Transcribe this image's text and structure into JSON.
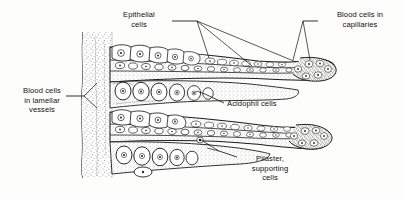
{
  "figure": {
    "background_color": "#fdfdfb",
    "ink_color": "#1a1a1a",
    "stipple_color": "#8a8a88"
  },
  "labels": {
    "epithelial": {
      "name": "Epithelial cells",
      "line1": "Epithelial",
      "line2": "cells"
    },
    "blood_capillaries": {
      "name": "Blood cells in capillaries",
      "line1": "Blood cells in",
      "line2": "capillaries"
    },
    "blood_lamellar": {
      "name": "Blood cells in lamellar vessels",
      "line1": "Blood cells",
      "line2": "in lamellar",
      "line3": "vessels"
    },
    "acidophil": {
      "name": "Acidophil cells",
      "line1": "Acidophil cells"
    },
    "pilaster": {
      "name": "Pilaster, supporting cells",
      "line1": "Pilaster,",
      "line2": "supporting",
      "line3": "cells"
    }
  },
  "structures": {
    "filament_shaft": "vertical stippled gill filament shaft",
    "upper_lamella": "upper secondary lamella with capillary channel",
    "lower_lamella": "lower secondary lamella with capillary channel",
    "middle_band": "middle cell mass between lamellae"
  }
}
